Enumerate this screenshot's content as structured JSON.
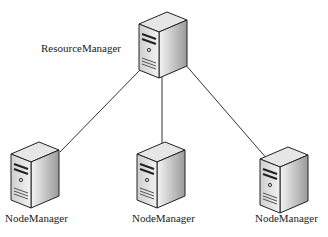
{
  "diagram": {
    "type": "yarn-architecture",
    "master": {
      "label": "ResourceManager",
      "icon": "server-icon"
    },
    "workers": [
      {
        "label": "NodeManager",
        "icon": "server-icon"
      },
      {
        "label": "NodeManager",
        "icon": "server-icon"
      },
      {
        "label": "NodeManager",
        "icon": "server-icon"
      }
    ],
    "edge_color": "#333333"
  }
}
